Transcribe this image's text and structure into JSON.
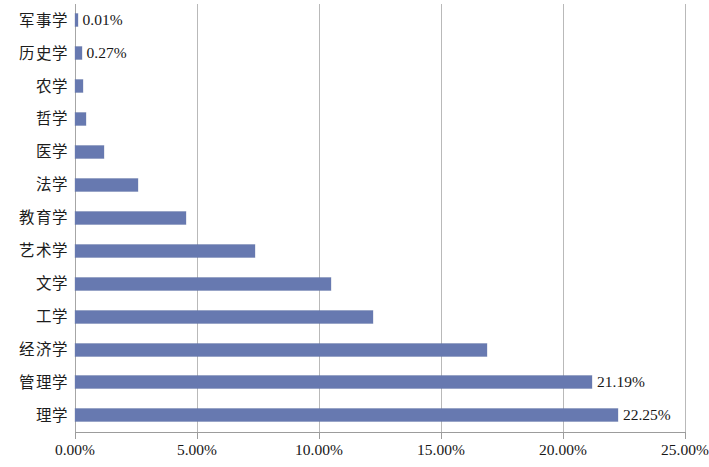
{
  "chart_data": {
    "type": "bar",
    "orientation": "horizontal",
    "title": "",
    "subtitle": "",
    "xlabel": "",
    "ylabel": "",
    "xlim": [
      0,
      25
    ],
    "grid": true,
    "legend": "none",
    "axis_tick_suffix": "%",
    "xticks": [
      {
        "value": 0,
        "label": "0.00%"
      },
      {
        "value": 5,
        "label": "5.00%"
      },
      {
        "value": 10,
        "label": "10.00%"
      },
      {
        "value": 15,
        "label": "15.00%"
      },
      {
        "value": 20,
        "label": "20.00%"
      },
      {
        "value": 25,
        "label": "25.00%"
      }
    ],
    "categories": [
      "军事学",
      "历史学",
      "农学",
      "哲学",
      "医学",
      "法学",
      "教育学",
      "艺术学",
      "文学",
      "工学",
      "经济学",
      "管理学",
      "理学"
    ],
    "values": [
      0.01,
      0.27,
      0.33,
      0.45,
      1.18,
      2.58,
      4.55,
      7.38,
      10.5,
      12.2,
      16.9,
      21.19,
      22.25
    ],
    "data_labels": [
      "0.01%",
      "0.27%",
      "",
      "",
      "",
      "",
      "",
      "",
      "",
      "",
      "",
      "21.19%",
      "22.25%"
    ],
    "series": [
      {
        "name": "占比",
        "color": "#6779b0",
        "values": [
          0.01,
          0.27,
          0.33,
          0.45,
          1.18,
          2.58,
          4.55,
          7.38,
          10.5,
          12.2,
          16.9,
          21.19,
          22.25
        ]
      }
    ],
    "colors": {
      "bar": "#6779b0",
      "gridline": "#b9b9b9",
      "axis": "#9c9c9c",
      "text": "#171717",
      "background": "#ffffff"
    }
  }
}
